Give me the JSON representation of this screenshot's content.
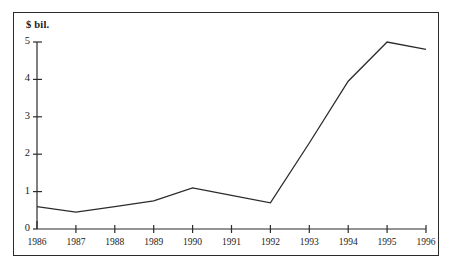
{
  "chart_data": {
    "type": "line",
    "title": "",
    "subtitle": "",
    "xlabel": "",
    "ylabel": "$ bil.",
    "unit_label": "$ bil.",
    "categories": [
      "1986",
      "1987",
      "1988",
      "1989",
      "1990",
      "1991",
      "1992",
      "1993",
      "1994",
      "1995",
      "1996"
    ],
    "x": [
      1986,
      1987,
      1988,
      1989,
      1990,
      1991,
      1992,
      1993,
      1994,
      1995,
      1996
    ],
    "values": [
      0.6,
      0.45,
      0.6,
      0.75,
      1.1,
      0.9,
      0.7,
      2.3,
      3.95,
      5.0,
      4.8
    ],
    "series": [
      {
        "name": "",
        "values": [
          0.6,
          0.45,
          0.6,
          0.75,
          1.1,
          0.9,
          0.7,
          2.3,
          3.95,
          5.0,
          4.8
        ]
      }
    ],
    "ylim": [
      0,
      5
    ],
    "xlim": [
      1986,
      1996
    ],
    "y_ticks": [
      0,
      1,
      2,
      3,
      4,
      5
    ],
    "y_tick_labels": [
      "0",
      "1",
      "2",
      "3",
      "4",
      "5"
    ],
    "x_ticks": [
      1986,
      1987,
      1988,
      1989,
      1990,
      1991,
      1992,
      1993,
      1994,
      1995,
      1996
    ],
    "grid": false,
    "legend": null,
    "legend_position": "none",
    "line_color": "#2b2b2b",
    "border_color": "#2b2b2b",
    "background_color": "#ffffff",
    "annotations": []
  }
}
